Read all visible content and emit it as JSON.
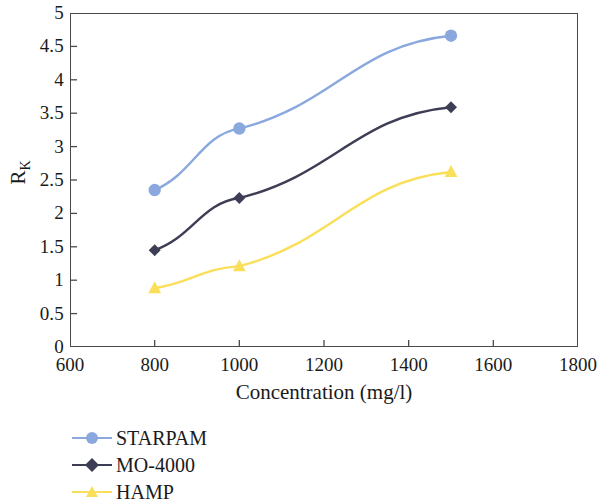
{
  "chart_data": {
    "type": "line",
    "title": "",
    "xlabel": "Concentration (mg/l)",
    "ylabel": "R",
    "ylabel_subscript": "K",
    "x": [
      800,
      1000,
      1500
    ],
    "xlim": [
      600,
      1800
    ],
    "ylim": [
      0,
      5
    ],
    "xticks": [
      "600",
      "800",
      "1000",
      "1200",
      "1400",
      "1600",
      "1800"
    ],
    "xtick_values": [
      600,
      800,
      1000,
      1200,
      1400,
      1600,
      1800
    ],
    "yticks": [
      "0",
      "0.5",
      "1",
      "1.5",
      "2",
      "2.5",
      "3",
      "3.5",
      "4",
      "4.5",
      "5"
    ],
    "ytick_values": [
      0,
      0.5,
      1,
      1.5,
      2,
      2.5,
      3,
      3.5,
      4,
      4.5,
      5
    ],
    "grid": false,
    "legend_position": "below-left",
    "series": [
      {
        "name": "STARPAM",
        "values": [
          2.35,
          3.27,
          4.66
        ],
        "color": "#8aa8de",
        "marker": "circle"
      },
      {
        "name": "MO-4000",
        "values": [
          1.45,
          2.23,
          3.59
        ],
        "color": "#3d3d55",
        "marker": "diamond"
      },
      {
        "name": "HAMP",
        "values": [
          0.88,
          1.21,
          2.62
        ],
        "color": "#fadf5a",
        "marker": "triangle"
      }
    ]
  },
  "axis": {
    "frame_color": "#4a4a4a"
  }
}
